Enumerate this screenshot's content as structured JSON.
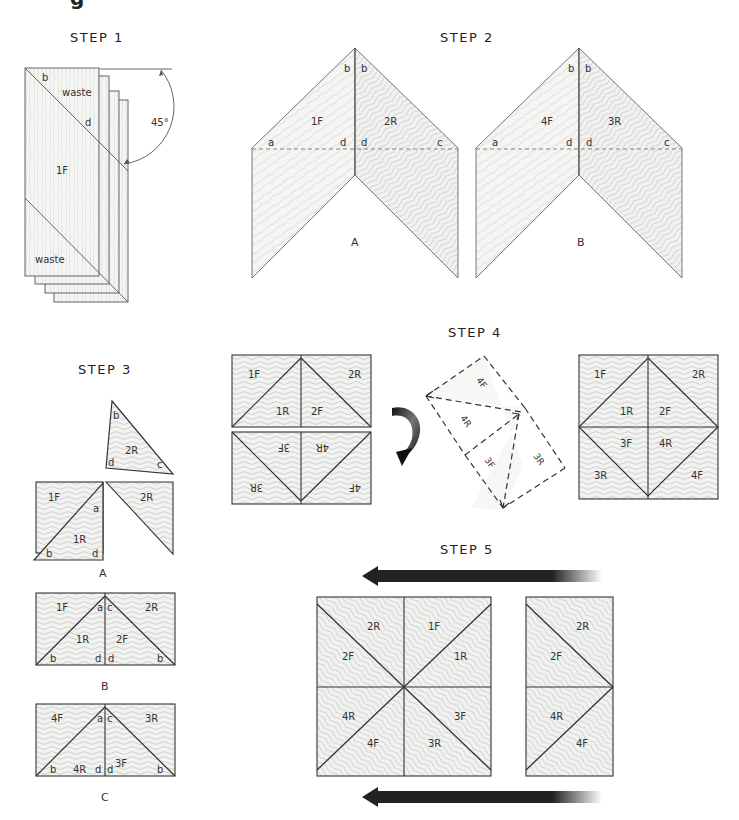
{
  "header_fragment": "g",
  "steps": {
    "step1": {
      "title": "STEP 1",
      "labels": {
        "b": "b",
        "waste_top": "waste",
        "d": "d",
        "piece": "1F",
        "waste_bottom": "waste",
        "angle": "45°"
      }
    },
    "step2": {
      "title": "STEP 2",
      "panel_a": {
        "caption": "A",
        "left_piece": "1F",
        "right_piece": "2R",
        "corners": {
          "b_left": "b",
          "b_right": "b",
          "a": "a",
          "d_left": "d",
          "d_right": "d",
          "c": "c"
        }
      },
      "panel_b": {
        "caption": "B",
        "left_piece": "4F",
        "right_piece": "3R",
        "corners": {
          "b_left": "b",
          "b_right": "b",
          "a": "a",
          "d_left": "d",
          "d_right": "d",
          "c": "c"
        }
      }
    },
    "step3": {
      "title": "STEP 3",
      "panel_a": {
        "caption": "A",
        "floating_piece": {
          "label": "2R",
          "b": "b",
          "d": "d",
          "c": "c"
        },
        "pieces": {
          "p1F": "1F",
          "p1R": "1R",
          "p2R": "2R",
          "a": "a",
          "b": "b",
          "d": "d"
        }
      },
      "panel_b": {
        "caption": "B",
        "pieces": {
          "p1F": "1F",
          "p1R": "1R",
          "p2F": "2F",
          "p2R": "2R"
        },
        "corners": {
          "a": "a",
          "c": "c",
          "b_left": "b",
          "d_left": "d",
          "d_right": "d",
          "b_right": "b"
        }
      },
      "panel_c": {
        "caption": "C",
        "pieces": {
          "p4F": "4F",
          "p4R": "4R",
          "p3F": "3F",
          "p3R": "3R"
        },
        "corners": {
          "a": "a",
          "c": "c",
          "b_left": "b",
          "d_left": "d",
          "d_right": "d",
          "b_right": "b"
        }
      }
    },
    "step4": {
      "title": "STEP 4",
      "assembly_left": {
        "top": {
          "p1F": "1F",
          "p1R": "1R",
          "p2F": "2F",
          "p2R": "2R"
        },
        "bottom_flipped": {
          "p3F": "3F",
          "p4R": "4R",
          "p3R": "3R",
          "p4F": "4F"
        }
      },
      "fold_diagram": {
        "p4F": "4F",
        "p4R": "4R",
        "p3F": "3F",
        "p3R": "3R"
      },
      "assembly_right": {
        "p1F": "1F",
        "p2R": "2R",
        "p1R": "1R",
        "p2F": "2F",
        "p3F": "3F",
        "p4R": "4R",
        "p3R": "3R",
        "p4F": "4F"
      }
    },
    "step5": {
      "title": "STEP 5",
      "full_panel": {
        "p2R": "2R",
        "p1F": "1F",
        "p2F": "2F",
        "p1R": "1R",
        "p4R": "4R",
        "p3F": "3F",
        "p4F": "4F",
        "p3R": "3R"
      },
      "half_panel": {
        "p2R": "2R",
        "p2F": "2F",
        "p4R": "4R",
        "p4F": "4F"
      }
    }
  },
  "colors": {
    "line": "#444444",
    "wood_fill": "#f4f4f2",
    "grain": "#bdbdbd",
    "arrow": "#222222"
  }
}
